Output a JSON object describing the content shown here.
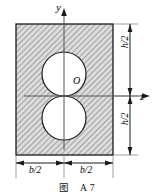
{
  "figure": {
    "caption": "图　A 7",
    "axes": {
      "vertical_label": "y",
      "horizontal_label": "z",
      "origin_label": "O"
    },
    "dimensions": {
      "width_left_label": "b/2",
      "width_right_label": "b/2",
      "height_top_label": "h/2",
      "height_bottom_label": "h/2"
    },
    "colors": {
      "line": "#1a1a1a",
      "hatch": "#7a7a7a",
      "fill": "#d9d9d9",
      "hole_fill": "#ffffff",
      "axis": "#4a4a4a"
    },
    "geometry": {
      "rect": {
        "x": 16,
        "y": 24,
        "width": 97,
        "height": 131
      },
      "origin": {
        "x": 64,
        "y": 96
      },
      "circle_top": {
        "cx": 64,
        "cy": 74,
        "r": 22
      },
      "circle_bottom": {
        "cx": 64,
        "cy": 118,
        "r": 22
      }
    }
  }
}
